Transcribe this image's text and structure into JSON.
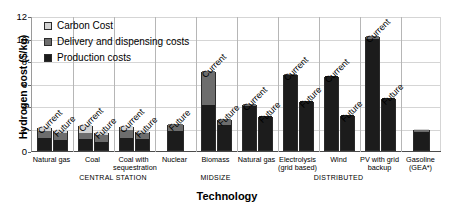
{
  "chart_data": {
    "type": "bar",
    "title": "",
    "xlabel": "Technology",
    "ylabel": "Hydrogen cost ($/kg)",
    "ylim": [
      0,
      12
    ],
    "yticks": [
      0,
      2,
      4,
      6,
      8,
      10,
      12
    ],
    "grid": true,
    "stacked": true,
    "legend_position": "top-left",
    "legend": [
      "Carbon Cost",
      "Delivery and dispensing costs",
      "Production costs"
    ],
    "series": [
      {
        "name": "Production costs",
        "color": "#1c1c1c"
      },
      {
        "name": "Delivery and dispensing costs",
        "color": "#6d6d6d"
      },
      {
        "name": "Carbon Cost",
        "color": "#d3d3d3"
      }
    ],
    "groups": [
      {
        "name": "CENTRAL STATION",
        "categories": [
          "Natural gas",
          "Coal",
          "Coal with sequestration",
          "Nuclear"
        ]
      },
      {
        "name": "MIDSIZE",
        "categories": [
          "Biomass"
        ]
      },
      {
        "name": "DISTRIBUTED",
        "categories": [
          "Natural gas",
          "Electrolysis (grid based)",
          "Wind",
          "PV with grid backup",
          "Gasoline (GEA*)"
        ]
      }
    ],
    "bars": [
      {
        "category": "Natural gas",
        "group": "CENTRAL STATION",
        "scenario": "Current",
        "production": 1.1,
        "delivery": 0.6,
        "carbon": 0.35,
        "total": 2.05
      },
      {
        "category": "Natural gas",
        "group": "CENTRAL STATION",
        "scenario": "Future",
        "production": 0.9,
        "delivery": 0.6,
        "carbon": 0.3,
        "total": 1.8
      },
      {
        "category": "Coal",
        "group": "CENTRAL STATION",
        "scenario": "Current",
        "production": 0.95,
        "delivery": 0.6,
        "carbon": 0.65,
        "total": 2.2
      },
      {
        "category": "Coal",
        "group": "CENTRAL STATION",
        "scenario": "Future",
        "production": 0.75,
        "delivery": 0.55,
        "carbon": 0.3,
        "total": 1.6
      },
      {
        "category": "Coal with sequestration",
        "group": "CENTRAL STATION",
        "scenario": "Current",
        "production": 1.1,
        "delivery": 0.65,
        "carbon": 0.4,
        "total": 2.15
      },
      {
        "category": "Coal with sequestration",
        "group": "CENTRAL STATION",
        "scenario": "Future",
        "production": 0.95,
        "delivery": 0.6,
        "carbon": 0.15,
        "total": 1.7
      },
      {
        "category": "Nuclear",
        "group": "CENTRAL STATION",
        "scenario": "Future",
        "production": 1.7,
        "delivery": 0.6,
        "carbon": 0.0,
        "total": 2.3
      },
      {
        "category": "Biomass",
        "group": "MIDSIZE",
        "scenario": "Current",
        "production": 4.0,
        "delivery": 3.0,
        "carbon": 0.0,
        "total": 7.0
      },
      {
        "category": "Biomass",
        "group": "MIDSIZE",
        "scenario": "Future",
        "production": 2.2,
        "delivery": 0.6,
        "carbon": 0.0,
        "total": 2.8
      },
      {
        "category": "Natural gas",
        "group": "DISTRIBUTED",
        "scenario": "Current",
        "production": 3.9,
        "delivery": 0.2,
        "carbon": 0.0,
        "total": 4.1
      },
      {
        "category": "Natural gas",
        "group": "DISTRIBUTED",
        "scenario": "Future",
        "production": 3.0,
        "delivery": 0.0,
        "carbon": 0.0,
        "total": 3.0
      },
      {
        "category": "Electrolysis (grid based)",
        "group": "DISTRIBUTED",
        "scenario": "Current",
        "production": 6.7,
        "delivery": 0.1,
        "carbon": 0.0,
        "total": 6.8
      },
      {
        "category": "Electrolysis (grid based)",
        "group": "DISTRIBUTED",
        "scenario": "Future",
        "production": 4.4,
        "delivery": 0.0,
        "carbon": 0.0,
        "total": 4.4
      },
      {
        "category": "Wind",
        "group": "DISTRIBUTED",
        "scenario": "Current",
        "production": 6.6,
        "delivery": 0.0,
        "carbon": 0.0,
        "total": 6.6
      },
      {
        "category": "Wind",
        "group": "DISTRIBUTED",
        "scenario": "Future",
        "production": 3.1,
        "delivery": 0.0,
        "carbon": 0.0,
        "total": 3.1
      },
      {
        "category": "PV with grid backup",
        "group": "DISTRIBUTED",
        "scenario": "Current",
        "production": 9.9,
        "delivery": 0.2,
        "carbon": 0.0,
        "total": 10.1
      },
      {
        "category": "PV with grid backup",
        "group": "DISTRIBUTED",
        "scenario": "Future",
        "production": 4.6,
        "delivery": 0.0,
        "carbon": 0.0,
        "total": 4.6
      },
      {
        "category": "Gasoline (GEA*)",
        "group": "DISTRIBUTED",
        "scenario": "",
        "production": 1.6,
        "delivery": 0.2,
        "carbon": 0.1,
        "total": 1.9
      }
    ]
  },
  "axis": {
    "y_title": "Hydrogen cost ($/kg)",
    "x_title": "Technology",
    "y_tick_labels": [
      "12",
      "10",
      "8",
      "6",
      "4",
      "2",
      "0"
    ]
  },
  "legend": {
    "items": [
      {
        "label": "Carbon Cost",
        "swatch": "carbon-swatch"
      },
      {
        "label": "Delivery and dispensing costs",
        "swatch": "delivery-swatch"
      },
      {
        "label": "Production costs",
        "swatch": "production-swatch"
      }
    ]
  },
  "categories": [
    {
      "line1": "Natural gas",
      "line2": ""
    },
    {
      "line1": "Coal",
      "line2": ""
    },
    {
      "line1": "Coal with",
      "line2": "sequestration"
    },
    {
      "line1": "Nuclear",
      "line2": ""
    },
    {
      "line1": "Biomass",
      "line2": ""
    },
    {
      "line1": "Natural gas",
      "line2": ""
    },
    {
      "line1": "Electrolysis",
      "line2": "(grid based)"
    },
    {
      "line1": "Wind",
      "line2": ""
    },
    {
      "line1": "PV with grid",
      "line2": "backup"
    },
    {
      "line1": "Gasoline",
      "line2": "(GEA*)"
    }
  ],
  "group_labels": [
    {
      "name": "CENTRAL STATION"
    },
    {
      "name": "MIDSIZE"
    },
    {
      "name": "DISTRIBUTED"
    }
  ],
  "annotations": {
    "current": "Current",
    "future": "Future"
  }
}
